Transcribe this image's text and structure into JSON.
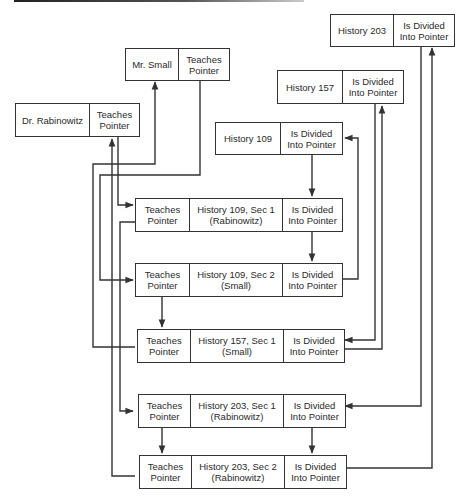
{
  "diagram": {
    "type": "linked-record-network",
    "colors": {
      "line": "#333333",
      "background": "#ffffff"
    },
    "instructors": [
      {
        "id": "small",
        "name": "Mr. Small",
        "pointer": "Teaches\nPointer"
      },
      {
        "id": "rabinowitz",
        "name": "Dr. Rabinowitz",
        "pointer": "Teaches\nPointer"
      }
    ],
    "courses": [
      {
        "id": "h203",
        "name": "History 203",
        "pointer": "Is Divided\nInto Pointer"
      },
      {
        "id": "h157",
        "name": "History 157",
        "pointer": "Is Divided\nInto Pointer"
      },
      {
        "id": "h109",
        "name": "History 109",
        "pointer": "Is Divided\nInto Pointer"
      }
    ],
    "sections": [
      {
        "id": "s109_1",
        "teaches": "Teaches\nPointer",
        "name": "History 109, Sec 1\n(Rabinowitz)",
        "divided": "Is Divided\nInto Pointer"
      },
      {
        "id": "s109_2",
        "teaches": "Teaches\nPointer",
        "name": "History 109, Sec 2\n(Small)",
        "divided": "Is Divided\nInto Pointer"
      },
      {
        "id": "s157_1",
        "teaches": "Teaches\nPointer",
        "name": "History 157, Sec 1\n(Small)",
        "divided": "Is Divided\nInto Pointer"
      },
      {
        "id": "s203_1",
        "teaches": "Teaches\nPointer",
        "name": "History 203, Sec 1\n(Rabinowitz)",
        "divided": "Is Divided\nInto Pointer"
      },
      {
        "id": "s203_2",
        "teaches": "Teaches\nPointer",
        "name": "History 203, Sec 2\n(Rabinowitz)",
        "divided": "Is Divided\nInto Pointer"
      }
    ],
    "links": [
      {
        "from": "Dr. Rabinowitz",
        "to": "History 109, Sec 1"
      },
      {
        "from": "History 109, Sec 1",
        "to": "History 203, Sec 1"
      },
      {
        "from": "History 203, Sec 1",
        "to": "History 203, Sec 2"
      },
      {
        "from": "History 203, Sec 2",
        "to": "Dr. Rabinowitz"
      },
      {
        "from": "Mr. Small",
        "to": "History 109, Sec 2"
      },
      {
        "from": "History 109, Sec 2",
        "to": "History 157, Sec 1"
      },
      {
        "from": "History 157, Sec 1",
        "to": "Mr. Small"
      },
      {
        "from": "History 109",
        "to": "History 109, Sec 1"
      },
      {
        "from": "History 109, Sec 1",
        "to": "History 109, Sec 2"
      },
      {
        "from": "History 109, Sec 2",
        "to": "History 109"
      },
      {
        "from": "History 157",
        "to": "History 157, Sec 1"
      },
      {
        "from": "History 157, Sec 1",
        "to": "History 157"
      },
      {
        "from": "History 203",
        "to": "History 203, Sec 1"
      },
      {
        "from": "History 203, Sec 1",
        "to": "History 203, Sec 2"
      },
      {
        "from": "History 203, Sec 2",
        "to": "History 203"
      }
    ]
  }
}
